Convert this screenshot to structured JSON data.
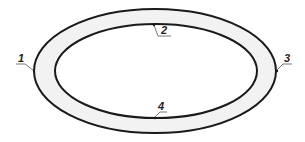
{
  "diagram": {
    "type": "elliptical-ring",
    "colors": {
      "stroke": "#1a1a1a",
      "ring_fill": "#f2f2f2",
      "background": "#ffffff"
    },
    "outer_ellipse": {
      "cx": 155,
      "cy": 71,
      "rx": 121,
      "ry": 62
    },
    "inner_ellipse": {
      "cx": 156,
      "cy": 71,
      "rx": 101,
      "ry": 47
    },
    "labels": [
      {
        "id": "1",
        "text": "1"
      },
      {
        "id": "2",
        "text": "2"
      },
      {
        "id": "3",
        "text": "3"
      },
      {
        "id": "4",
        "text": "4"
      }
    ]
  }
}
